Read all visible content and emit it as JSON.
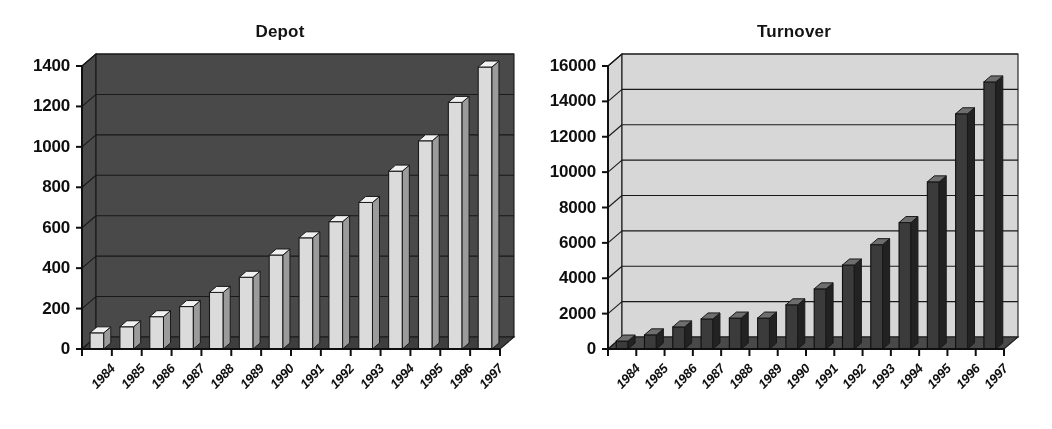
{
  "figure": {
    "kind": "two-panel-bar-chart-figure",
    "background_color": "#ffffff",
    "style": "grayscale scanned 3-D column chart"
  },
  "panels": [
    {
      "id": "depot",
      "title": "Depot",
      "plot_background_color": "#4a4a4a",
      "bar_fill_color": "#d9d9d9",
      "bar_edge_color": "#111111",
      "gridline_color": "#111111",
      "axis_color": "#111111"
    },
    {
      "id": "turnover",
      "title": "Turnover",
      "plot_background_color": "#d5d5d5",
      "bar_fill_color": "#3c3c3c",
      "bar_edge_color": "#111111",
      "gridline_color": "#111111",
      "axis_color": "#111111"
    }
  ],
  "chart_data": [
    {
      "type": "bar",
      "title": "Depot",
      "xlabel": "",
      "ylabel": "",
      "categories": [
        "1984",
        "1985",
        "1986",
        "1987",
        "1988",
        "1989",
        "1990",
        "1991",
        "1992",
        "1993",
        "1994",
        "1995",
        "1996",
        "1997"
      ],
      "values": [
        80,
        110,
        160,
        210,
        280,
        355,
        465,
        550,
        630,
        725,
        880,
        1030,
        1220,
        1395
      ],
      "ylim": [
        0,
        1400
      ],
      "yticks": [
        0,
        200,
        400,
        600,
        800,
        1000,
        1200,
        1400
      ],
      "ytick_labels": [
        "0",
        "200",
        "400",
        "600",
        "800",
        "1000",
        "1200",
        "1400"
      ],
      "grid": true,
      "grid_axis": "y",
      "legend": false,
      "legend_position": "none",
      "bar_style": "3d-column",
      "bar_color": "#d9d9d9",
      "plot_bgcolor": "#4a4a4a"
    },
    {
      "type": "bar",
      "title": "Turnover",
      "xlabel": "",
      "ylabel": "",
      "categories": [
        "1984",
        "1985",
        "1986",
        "1987",
        "1988",
        "1989",
        "1990",
        "1991",
        "1992",
        "1993",
        "1994",
        "1995",
        "1996",
        "1997"
      ],
      "values": [
        450,
        800,
        1250,
        1700,
        1750,
        1750,
        2500,
        3400,
        4750,
        5900,
        7150,
        9450,
        13300,
        15100
      ],
      "ylim": [
        0,
        16000
      ],
      "yticks": [
        0,
        2000,
        4000,
        6000,
        8000,
        10000,
        12000,
        14000,
        16000
      ],
      "ytick_labels": [
        "0",
        "2000",
        "4000",
        "6000",
        "8000",
        "10000",
        "12000",
        "14000",
        "16000"
      ],
      "grid": true,
      "grid_axis": "y",
      "legend": false,
      "legend_position": "none",
      "bar_style": "3d-column",
      "bar_color": "#3c3c3c",
      "plot_bgcolor": "#d5d5d5"
    }
  ]
}
